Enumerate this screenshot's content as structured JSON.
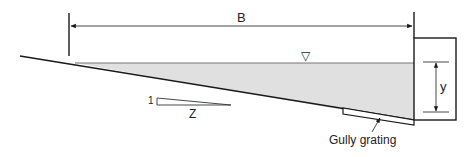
{
  "diagram": {
    "labels": {
      "width": "B",
      "depth": "y",
      "slope_vertical": "1",
      "slope_horizontal": "Z",
      "water_surface_symbol": "▽",
      "grating": "Gully grating"
    },
    "colors": {
      "line": "#1a1a1a",
      "water_fill": "#e0e0e0",
      "background": "#ffffff"
    }
  }
}
